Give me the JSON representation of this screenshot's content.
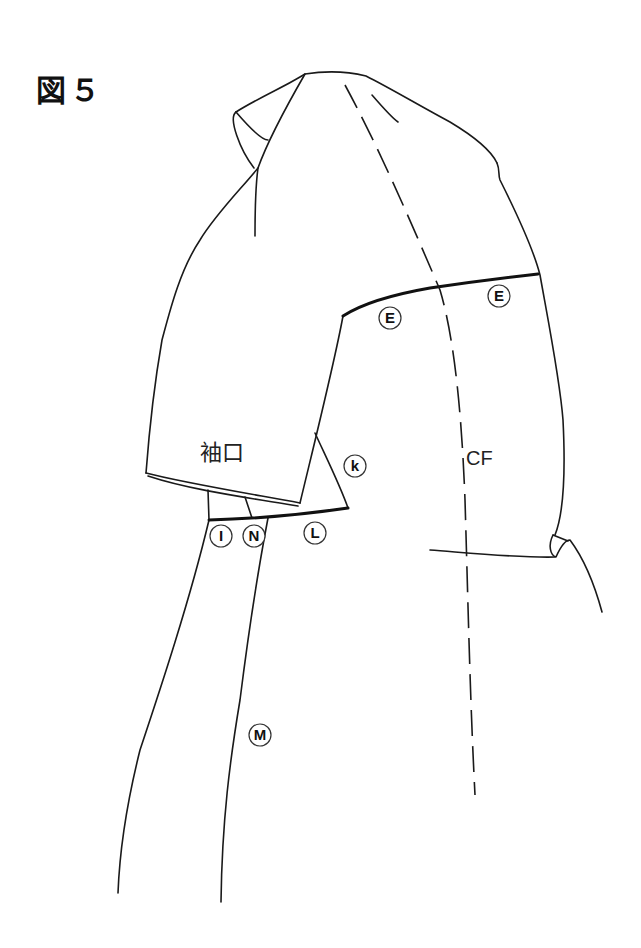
{
  "figure": {
    "title": "図５"
  },
  "labels": {
    "cuff": "袖口",
    "center_front": "CF",
    "points": {
      "E1": "E",
      "E2": "E",
      "K": "k",
      "L": "L",
      "I": "I",
      "N": "N",
      "M": "M"
    }
  },
  "colors": {
    "line": "#1a1a1a",
    "background": "#ffffff"
  }
}
